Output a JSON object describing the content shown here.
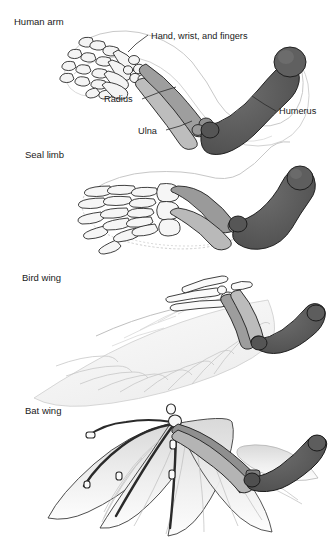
{
  "figure": {
    "background_color": "#ffffff",
    "ink_color": "#1a1a1a",
    "panels": [
      {
        "id": "human-arm",
        "title": "Human arm"
      },
      {
        "id": "seal-limb",
        "title": "Seal limb"
      },
      {
        "id": "bird-wing",
        "title": "Bird wing"
      },
      {
        "id": "bat-wing",
        "title": "Bat wing"
      }
    ],
    "callouts": [
      {
        "id": "hand-wrist-fingers",
        "label": "Hand, wrist, and fingers"
      },
      {
        "id": "radius",
        "label": "Radius"
      },
      {
        "id": "ulna",
        "label": "Ulna"
      },
      {
        "id": "humerus",
        "label": "Humerus"
      }
    ],
    "bone_shading": {
      "humerus_color": "#5a5a5a",
      "radius_ulna_color": "#a8a8a8",
      "hand_color": "#f2f2f2",
      "soft_tissue_color": "#e9e9e9",
      "outline_color": "#1f1f1f"
    }
  }
}
